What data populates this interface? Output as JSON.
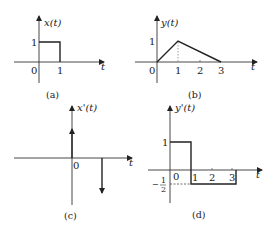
{
  "panels": {
    "a": {
      "caption": "(a)",
      "ylabel": "x(t)",
      "xlabel": "t",
      "ytick": "1",
      "xticks": [
        "0",
        "1"
      ],
      "description": "Rectangular pulse of height 1 from t=0 to t=1"
    },
    "b": {
      "caption": "(b)",
      "ylabel": "y(t)",
      "xlabel": "t",
      "ytick": "1",
      "xticks": [
        "0",
        "1",
        "2",
        "3"
      ],
      "description": "Triangle rising from (0,0) to (1,1) then falling to (3,0)"
    },
    "c": {
      "caption": "(c)",
      "ylabel": "x'(t)",
      "xlabel": "t",
      "xticks": [
        "0"
      ],
      "description": "Positive impulse at t=0 and negative impulse at t=1"
    },
    "d": {
      "caption": "(d)",
      "ylabel": "y'(t)",
      "xlabel": "t",
      "ytick_pos": "1",
      "ytick_neg_minus": "−",
      "ytick_neg_num": "1",
      "ytick_neg_den": "2",
      "xticks": [
        "0",
        "1",
        "2",
        "3"
      ],
      "description": "y'(t)=1 on (0,1), y'(t)=-1/2 on (1,3), 0 elsewhere"
    }
  }
}
